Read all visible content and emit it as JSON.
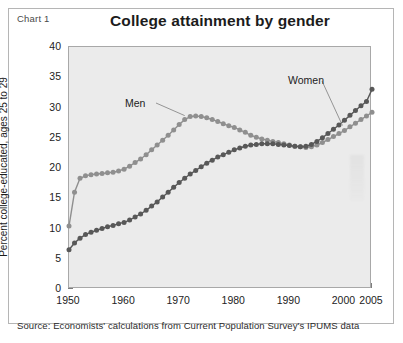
{
  "figure": {
    "chart_label": "Chart 1",
    "title": "College attainment by gender",
    "source": "Source: Economists' calculations from Current Population Survey's IPUMS data"
  },
  "annotations": {
    "men": "Men",
    "women": "Women"
  },
  "colors": {
    "men": "#8f8f8f",
    "women": "#585858",
    "plot_background": "#ebebeb",
    "frame": "#b5b5b5",
    "axis": "#7d7d7d",
    "text": "#1c1c1c"
  },
  "axes": {
    "y_ticks": [
      0,
      5,
      10,
      15,
      20,
      25,
      30,
      35,
      40
    ],
    "x_ticks": [
      1950,
      1960,
      1970,
      1980,
      1990,
      2000,
      2005
    ],
    "x_tick_labels": [
      "1950",
      "1960",
      "1970",
      "1980",
      "1990",
      "2000",
      "2005"
    ],
    "y_tick_labels": [
      "0",
      "5",
      "10",
      "15",
      "20",
      "25",
      "30",
      "35",
      "40"
    ],
    "ylabel": "Percent college-educated, ages 25 to 29",
    "xlabel": ""
  },
  "chart_data": {
    "type": "line",
    "title": "College attainment by gender",
    "xlabel": "",
    "ylabel": "Percent college-educated, ages 25 to 29",
    "xlim": [
      1950,
      2005
    ],
    "ylim": [
      0,
      40
    ],
    "grid": false,
    "legend": "annotated-inline",
    "marker": "circle",
    "x": [
      1950,
      1951,
      1952,
      1953,
      1954,
      1955,
      1956,
      1957,
      1958,
      1959,
      1960,
      1961,
      1962,
      1963,
      1964,
      1965,
      1966,
      1967,
      1968,
      1969,
      1970,
      1971,
      1972,
      1973,
      1974,
      1975,
      1976,
      1977,
      1978,
      1979,
      1980,
      1981,
      1982,
      1983,
      1984,
      1985,
      1986,
      1987,
      1988,
      1989,
      1990,
      1991,
      1992,
      1993,
      1994,
      1995,
      1996,
      1997,
      1998,
      1999,
      2000,
      2001,
      2002,
      2003,
      2004,
      2005
    ],
    "series": [
      {
        "name": "Men",
        "color": "#8f8f8f",
        "values": [
          10.4,
          16.0,
          18.3,
          18.7,
          18.9,
          19.0,
          19.1,
          19.2,
          19.3,
          19.5,
          19.8,
          20.3,
          20.9,
          21.5,
          22.2,
          23.0,
          23.8,
          24.6,
          25.4,
          26.3,
          27.2,
          28.0,
          28.5,
          28.6,
          28.5,
          28.3,
          28.0,
          27.7,
          27.3,
          27.0,
          26.7,
          26.3,
          25.9,
          25.4,
          25.1,
          24.8,
          24.6,
          24.4,
          24.2,
          24.0,
          23.8,
          23.6,
          23.5,
          23.4,
          23.5,
          23.8,
          24.2,
          24.7,
          25.2,
          25.7,
          26.2,
          26.8,
          27.4,
          28.0,
          28.6,
          29.2
        ]
      },
      {
        "name": "Women",
        "color": "#585858",
        "values": [
          6.5,
          7.6,
          8.4,
          9.0,
          9.4,
          9.7,
          10.0,
          10.3,
          10.5,
          10.8,
          11.0,
          11.4,
          11.9,
          12.4,
          13.0,
          13.7,
          14.4,
          15.2,
          16.0,
          16.8,
          17.6,
          18.3,
          19.0,
          19.6,
          20.2,
          20.8,
          21.3,
          21.8,
          22.2,
          22.6,
          23.0,
          23.3,
          23.6,
          23.8,
          23.9,
          24.0,
          24.0,
          24.0,
          23.9,
          23.8,
          23.7,
          23.6,
          23.5,
          23.6,
          23.9,
          24.4,
          25.0,
          25.7,
          26.4,
          27.1,
          27.9,
          28.7,
          29.5,
          30.3,
          31.0,
          33.0
        ]
      }
    ]
  }
}
